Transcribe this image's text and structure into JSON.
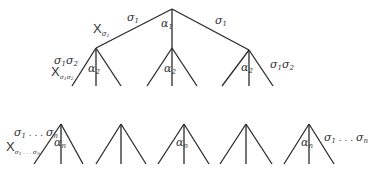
{
  "diagram": {
    "type": "tree",
    "root": {
      "edges": [
        {
          "label": "σ1",
          "to": "left"
        },
        {
          "label": "α1",
          "to": "middle"
        },
        {
          "label": "σ1",
          "to": "right"
        }
      ],
      "x_label": "X",
      "x_subscript": "σ1"
    },
    "level2": {
      "left": {
        "left_label": "σ1σ2",
        "x_label": "X",
        "x_subscript": "σ1σ2",
        "middle_label": "α2"
      },
      "middle": {
        "middle_label": "α2"
      },
      "right": {
        "middle_label": "α2",
        "right_label": "σ1σ2"
      }
    },
    "bottom_row": {
      "count": 5,
      "first": {
        "left_label": "σ1 . . . σn",
        "x_label": "X",
        "x_subscript": "σ1 . . . σn",
        "middle_label": "αn"
      },
      "third": {
        "middle_label": "αn"
      },
      "fifth": {
        "middle_label": "αn",
        "right_label": "σ1 . . . σn"
      }
    }
  },
  "labels": {
    "sigma": "σ",
    "alpha": "α",
    "one": "1",
    "two": "2",
    "n": "n",
    "dots": " . . . ",
    "X": "X"
  }
}
